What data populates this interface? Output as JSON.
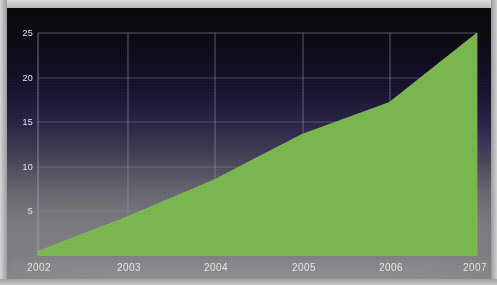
{
  "chart_data": {
    "type": "area",
    "title": "",
    "subtitle": "",
    "xlabel": "",
    "ylabel": "",
    "categories": [
      "2002",
      "2003",
      "2004",
      "2005",
      "2006",
      "2007"
    ],
    "x": [
      2002,
      2003,
      2004,
      2005,
      2006,
      2007
    ],
    "values": [
      0.5,
      4.3,
      8.5,
      13.6,
      17.2,
      25.0
    ],
    "series": [
      {
        "name": "",
        "values": [
          0.5,
          4.3,
          8.5,
          13.6,
          17.2,
          25.0
        ]
      }
    ],
    "xlim": [
      2002,
      2007
    ],
    "ylim": [
      0,
      25
    ],
    "y_ticks": [
      5,
      10,
      15,
      20,
      25
    ],
    "y_tick_labels": [
      "5",
      "10",
      "15",
      "20",
      "25"
    ],
    "x_ticks": [
      2002,
      2003,
      2004,
      2005,
      2006,
      2007
    ],
    "x_tick_labels": [
      "2002",
      "2003",
      "2004",
      "2005",
      "2006",
      "2007"
    ],
    "grid": true,
    "grid_axis": "both",
    "legend": false,
    "legend_position": "none",
    "annotations": [],
    "colors": {
      "area": "#7ab84e",
      "area_edge": "#86c25a",
      "grid": "#9b9ba6",
      "tick_text": "#e6e7e9",
      "background_top": "#070609",
      "background_mid": "#2b2546",
      "background_bottom": "#7f8084",
      "footer_band": "#87888b",
      "page_edge": "#c9cacb"
    }
  },
  "axes": {
    "y_ticks": [
      {
        "label": "25",
        "value": 25
      },
      {
        "label": "20",
        "value": 20
      },
      {
        "label": "15",
        "value": 15
      },
      {
        "label": "10",
        "value": 10
      },
      {
        "label": "5",
        "value": 5
      }
    ],
    "x_ticks": [
      {
        "label": "2002",
        "value": 2002
      },
      {
        "label": "2003",
        "value": 2003
      },
      {
        "label": "2004",
        "value": 2004
      },
      {
        "label": "2005",
        "value": 2005
      },
      {
        "label": "2006",
        "value": 2006
      },
      {
        "label": "2007",
        "value": 2007
      }
    ]
  }
}
